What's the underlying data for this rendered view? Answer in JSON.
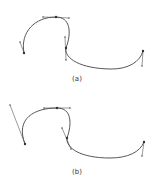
{
  "figure": {
    "panels": [
      {
        "label": "(a)",
        "description": "Bezier path with smooth nodes; control handles shown",
        "curve": "M24,53 C20,32 35,17 56,17 C70,17 72,32 66,48 C64,58 80,69 112,69 C128,69 140,62 143,51",
        "handles": [
          {
            "x1": 24,
            "y1": 53,
            "x2": 20,
            "y2": 42
          },
          {
            "x1": 43,
            "y1": 17,
            "x2": 69,
            "y2": 18
          },
          {
            "x1": 65,
            "y1": 37,
            "x2": 66,
            "y2": 60
          },
          {
            "x1": 143,
            "y1": 51,
            "x2": 142,
            "y2": 66
          }
        ],
        "nodes": [
          [
            24,
            53
          ],
          [
            56,
            17
          ],
          [
            66,
            48
          ],
          [
            143,
            51
          ]
        ],
        "handle_points": [
          [
            20,
            42
          ],
          [
            43,
            17
          ],
          [
            69,
            18
          ],
          [
            65,
            37
          ],
          [
            66,
            60
          ],
          [
            142,
            66
          ]
        ]
      },
      {
        "label": "(b)",
        "description": "Same path with left node handle extended and middle handle broken",
        "curve": "M25,144 C15,118 35,108 57,108 C72,108 72,124 67,138 C66,148 80,158 110,158 C128,158 140,152 144,142",
        "handles": [
          {
            "x1": 25,
            "y1": 144,
            "x2": 10,
            "y2": 105
          },
          {
            "x1": 44,
            "y1": 108,
            "x2": 70,
            "y2": 108
          },
          {
            "x1": 62,
            "y1": 128,
            "x2": 71,
            "y2": 149
          },
          {
            "x1": 144,
            "y1": 142,
            "x2": 142,
            "y2": 156
          }
        ],
        "nodes": [
          [
            25,
            144
          ],
          [
            57,
            108
          ],
          [
            67,
            138
          ],
          [
            144,
            142
          ]
        ],
        "handle_points": [
          [
            10,
            105
          ],
          [
            44,
            108
          ],
          [
            70,
            108
          ],
          [
            62,
            128
          ],
          [
            71,
            149
          ],
          [
            142,
            156
          ]
        ]
      }
    ]
  },
  "labels": {
    "a": "(a)",
    "b": "(b)"
  }
}
